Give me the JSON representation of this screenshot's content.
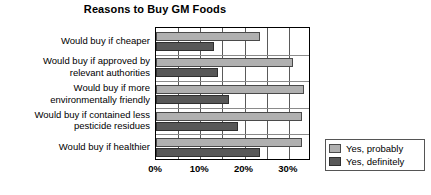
{
  "chart_data": {
    "type": "bar",
    "orientation": "horizontal",
    "title": "Reasons to Buy GM Foods",
    "xlabel": "",
    "ylabel": "",
    "xlim": [
      0,
      35
    ],
    "xticks": [
      "0%",
      "10%",
      "20%",
      "30%"
    ],
    "xtick_values": [
      0,
      10,
      20,
      30
    ],
    "grid": true,
    "grid_step": 5,
    "legend_position": "right-bottom",
    "categories": [
      "Would buy if cheaper",
      "Would buy if approved by relevant authorities",
      "Would buy if more environmentally friendly",
      "Would buy if contained less pesticide residues",
      "Would buy if healthier"
    ],
    "series": [
      {
        "name": "Yes, probably",
        "color": "#b0b0b0",
        "values": [
          23.5,
          31.0,
          33.5,
          33.0,
          33.0
        ]
      },
      {
        "name": "Yes, definitely",
        "color": "#585858",
        "values": [
          13.0,
          14.0,
          16.5,
          18.5,
          23.5
        ]
      }
    ]
  },
  "category_lines": [
    [
      "Would buy if cheaper"
    ],
    [
      "Would buy if approved by",
      "relevant authorities"
    ],
    [
      "Would buy if more",
      "environmentally friendly"
    ],
    [
      "Would buy if contained less",
      "pesticide residues"
    ],
    [
      "Would buy if healthier"
    ]
  ],
  "legend": {
    "items": [
      {
        "label": "Yes, probably"
      },
      {
        "label": "Yes, definitely"
      }
    ]
  }
}
